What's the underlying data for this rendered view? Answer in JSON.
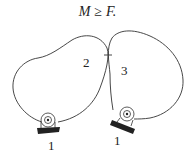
{
  "formula": {
    "lhs": "M",
    "operator": "≥",
    "rhs": "F."
  },
  "diagram": {
    "bodies": [
      {
        "id": "body-2",
        "label": "2"
      },
      {
        "id": "body-3",
        "label": "3"
      }
    ],
    "supports": [
      {
        "id": "support-left",
        "label": "1"
      },
      {
        "id": "support-right",
        "label": "1"
      }
    ],
    "colors": {
      "stroke": "#333333",
      "background": "#ffffff"
    }
  }
}
